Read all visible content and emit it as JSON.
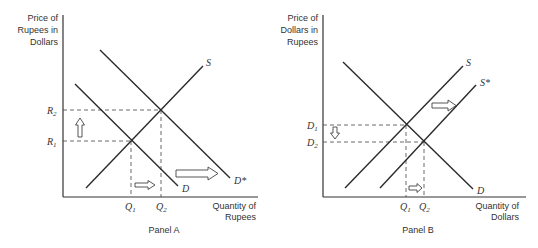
{
  "panels": [
    {
      "id": "A",
      "caption": "Panel A",
      "y_axis_label": [
        "Price of",
        "Rupees in",
        "Dollars"
      ],
      "x_axis_label": [
        "Quantity of",
        "Rupees"
      ],
      "price_labels": [
        {
          "base": "R",
          "sub": "2"
        },
        {
          "base": "R",
          "sub": "1"
        }
      ],
      "quantity_labels": [
        {
          "base": "Q",
          "sub": "1"
        },
        {
          "base": "Q",
          "sub": "2"
        }
      ],
      "curves": [
        {
          "label": "S",
          "kind": "supply"
        },
        {
          "label": "D",
          "kind": "demand"
        },
        {
          "label": "D*",
          "kind": "demand-shifted"
        }
      ],
      "shift_arrows": [
        "price-up",
        "quantity-right",
        "demand-right"
      ]
    },
    {
      "id": "B",
      "caption": "Panel B",
      "y_axis_label": [
        "Price of",
        "Dollars in",
        "Rupees"
      ],
      "x_axis_label": [
        "Quantity of",
        "Dollars"
      ],
      "price_labels": [
        {
          "base": "D",
          "sub": "1"
        },
        {
          "base": "D",
          "sub": "2"
        }
      ],
      "quantity_labels": [
        {
          "base": "Q",
          "sub": "1"
        },
        {
          "base": "Q",
          "sub": "2"
        }
      ],
      "curves": [
        {
          "label": "S",
          "kind": "supply"
        },
        {
          "label": "S*",
          "kind": "supply-shifted"
        },
        {
          "label": "D",
          "kind": "demand"
        }
      ],
      "shift_arrows": [
        "price-down",
        "quantity-right",
        "supply-right"
      ]
    }
  ]
}
